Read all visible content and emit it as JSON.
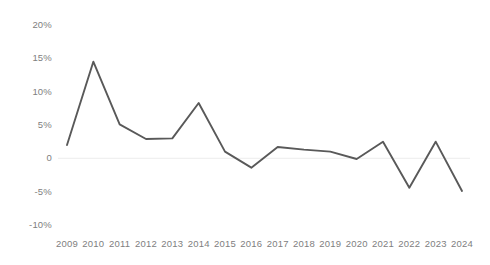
{
  "chart_data": {
    "type": "line",
    "title": "",
    "subtitle": "",
    "xlabel": "",
    "ylabel": "",
    "categories": [
      "2009",
      "2010",
      "2011",
      "2012",
      "2013",
      "2014",
      "2015",
      "2016",
      "2017",
      "2018",
      "2019",
      "2020",
      "2021",
      "2022",
      "2023",
      "2024"
    ],
    "values": [
      2.0,
      14.5,
      5.1,
      2.9,
      3.0,
      8.3,
      1.0,
      -1.4,
      1.7,
      1.3,
      1.0,
      -0.1,
      2.5,
      -4.4,
      2.5,
      -4.9
    ],
    "series": [
      {
        "name": "Series 1",
        "values": [
          2.0,
          14.5,
          5.1,
          2.9,
          3.0,
          8.3,
          1.0,
          -1.4,
          1.7,
          1.3,
          1.0,
          -0.1,
          2.5,
          -4.4,
          2.5,
          -4.9
        ]
      }
    ],
    "ylim": [
      -10,
      20
    ],
    "yticks": [
      20,
      15,
      10,
      5,
      0,
      -5,
      -10
    ],
    "ytick_labels": [
      "20%",
      "15%",
      "10%",
      "5%",
      "0",
      "-5%",
      "-10%"
    ],
    "grid": "zero-line-only",
    "legend": "none",
    "line_color": "#595959",
    "axis_text_color": "#808080",
    "gridline_color": "#f0f0f0",
    "background_color": "#ffffff"
  }
}
